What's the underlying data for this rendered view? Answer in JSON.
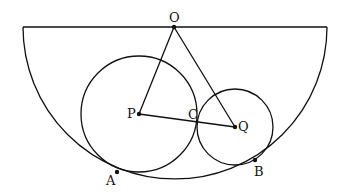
{
  "diagram": {
    "type": "geometry",
    "points": {
      "O": {
        "label": "O",
        "x": 174,
        "y": 27
      },
      "P": {
        "label": "P",
        "x": 139,
        "y": 114
      },
      "Q": {
        "label": "Q",
        "x": 235,
        "y": 127
      },
      "C": {
        "label": "C",
        "x": 199,
        "y": 122
      },
      "A": {
        "label": "A",
        "x": 117,
        "y": 172
      },
      "B": {
        "label": "B",
        "x": 255,
        "y": 160
      }
    },
    "shapes": {
      "semicircle": {
        "center": "O",
        "radius": 152
      },
      "circle_P": {
        "center": "P",
        "radius": 58
      },
      "circle_Q": {
        "center": "Q",
        "radius": 38
      }
    },
    "segments": [
      "OP",
      "OQ",
      "PQ"
    ],
    "stroke_color": "#111111"
  }
}
